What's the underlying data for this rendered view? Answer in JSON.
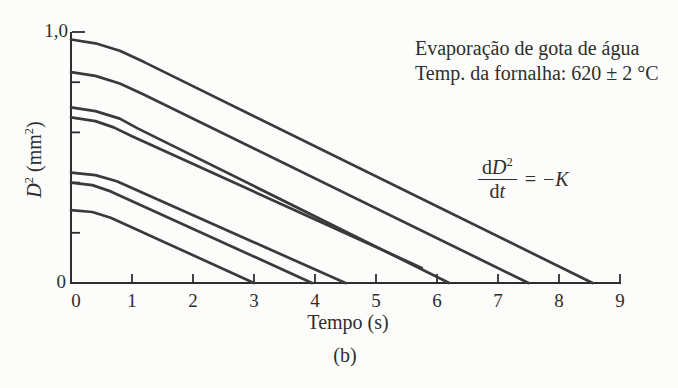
{
  "figure": {
    "background": "#fcfcfa",
    "ink": "#2e2e2e",
    "curve_color": "#3a3a3a",
    "caption": "(b)"
  },
  "annotations": {
    "info_line1": "Evaporação de gota de água",
    "info_line2": "Temp. da fornalha: 620 ± 2 °C",
    "equation": {
      "num_d": "d",
      "num_D": "D",
      "num_exp": "2",
      "den_d": "d",
      "den_t": "t",
      "rhs_eq": "=",
      "rhs_minus": "−",
      "rhs_K": "K"
    }
  },
  "axes": {
    "ylabel_D": "D",
    "ylabel_exp": "2",
    "ylabel_unit_open": " (mm",
    "ylabel_unit_exp": "2",
    "ylabel_unit_close": ")",
    "xlabel": "Tempo (s)",
    "y_top_label": "1,0",
    "y_zero_label": "0"
  },
  "chart_data": {
    "type": "line",
    "title": "Evaporação de gota de água",
    "condition": "Temp. da fornalha: 620 ± 2 °C",
    "relation": "dD²/dt = −K",
    "xlabel": "Tempo (s)",
    "ylabel": "D² (mm²)",
    "xlim": [
      0,
      9
    ],
    "ylim": [
      0,
      1.0
    ],
    "x_ticks": [
      0,
      1,
      2,
      3,
      4,
      5,
      6,
      7,
      8,
      9
    ],
    "y_ticks": [
      0,
      0.2,
      0.4,
      0.6,
      0.8,
      1.0
    ],
    "y_tick_labels": [
      "0",
      "",
      "",
      "",
      "",
      "1,0"
    ],
    "grid": false,
    "legend": "none",
    "series": [
      {
        "name": "gota-1",
        "x_intercept": 8.55,
        "points": [
          [
            0,
            0.97
          ],
          [
            0.4,
            0.955
          ],
          [
            0.8,
            0.925
          ],
          [
            1.2,
            0.88
          ],
          [
            8.55,
            0
          ]
        ]
      },
      {
        "name": "gota-2",
        "x_intercept": 7.5,
        "points": [
          [
            0,
            0.84
          ],
          [
            0.4,
            0.825
          ],
          [
            0.8,
            0.795
          ],
          [
            1.2,
            0.75
          ],
          [
            7.5,
            0
          ]
        ]
      },
      {
        "name": "gota-3",
        "x_intercept": 6.2,
        "points": [
          [
            0,
            0.7
          ],
          [
            0.4,
            0.685
          ],
          [
            0.8,
            0.655
          ],
          [
            1.1,
            0.615
          ],
          [
            6.2,
            0
          ]
        ]
      },
      {
        "name": "gota-4",
        "x_intercept": null,
        "points": [
          [
            0,
            0.66
          ],
          [
            0.4,
            0.645
          ],
          [
            0.7,
            0.62
          ],
          [
            1.0,
            0.585
          ],
          [
            5.75,
            0.06
          ]
        ]
      },
      {
        "name": "gota-5",
        "x_intercept": 4.5,
        "points": [
          [
            0,
            0.44
          ],
          [
            0.4,
            0.43
          ],
          [
            0.75,
            0.405
          ],
          [
            4.5,
            0
          ]
        ]
      },
      {
        "name": "gota-6",
        "x_intercept": 3.95,
        "points": [
          [
            0,
            0.4
          ],
          [
            0.35,
            0.39
          ],
          [
            0.65,
            0.365
          ],
          [
            3.95,
            0
          ]
        ]
      },
      {
        "name": "gota-7",
        "x_intercept": 3.0,
        "points": [
          [
            0,
            0.29
          ],
          [
            0.35,
            0.283
          ],
          [
            0.65,
            0.26
          ],
          [
            3.0,
            0
          ]
        ]
      }
    ]
  }
}
